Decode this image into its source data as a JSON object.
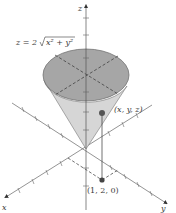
{
  "figure": {
    "equation_label": "z = 2√(x² + y²)",
    "equation_parts": {
      "lhs": "z = 2",
      "radicand": "x² + y²"
    },
    "point_label": "(x, y, z)",
    "projection_label": "(1, 2, 0)",
    "axes": {
      "x": "x",
      "y": "y",
      "z": "z"
    },
    "colors": {
      "cone_top": "#a6a6a6",
      "cone_side": "#d6d6d6",
      "axis": "#555555",
      "point": "#555555"
    }
  }
}
